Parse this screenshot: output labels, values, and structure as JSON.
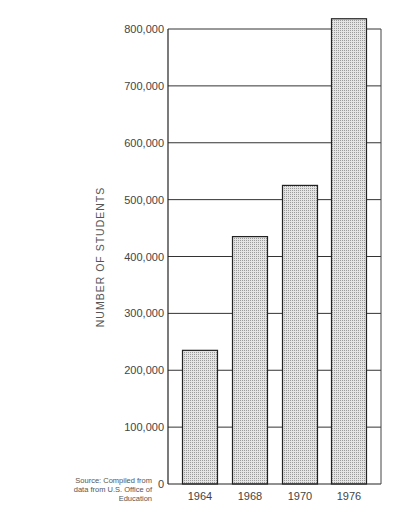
{
  "chart_data": {
    "type": "bar",
    "title": "",
    "xlabel": "",
    "ylabel": "NUMBER OF STUDENTS",
    "categories": [
      "1964",
      "1968",
      "1970",
      "1976"
    ],
    "values": [
      235000,
      435000,
      525000,
      818000
    ],
    "ylim": [
      0,
      800000
    ],
    "yticks": [
      0,
      100000,
      200000,
      300000,
      400000,
      500000,
      600000,
      700000,
      800000
    ],
    "ytick_labels": [
      "0",
      "100,000",
      "200,000",
      "300,000",
      "400,000",
      "500,000",
      "600,000",
      "700,000",
      "800,000"
    ],
    "grid": true,
    "legend": null,
    "bar_fill": "#d4d4d4",
    "bar_stroke": "#222222"
  },
  "source_note": {
    "line1": "Source: Compiled from",
    "line2": "data from U.S. Office of",
    "line3": "Education"
  }
}
